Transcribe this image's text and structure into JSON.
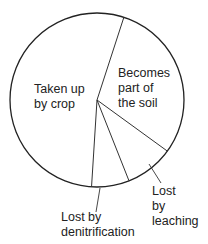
{
  "chart_data": {
    "type": "pie",
    "title": "",
    "start_angle_deg": 18,
    "direction": "clockwise",
    "slices": [
      {
        "label": "Becomes part of the soil",
        "value": 30
      },
      {
        "label": "Lost by leaching",
        "value": 9
      },
      {
        "label": "Lost by denitrification",
        "value": 7
      },
      {
        "label": "Taken up by crop",
        "value": 54
      }
    ],
    "colors": {
      "fill": "#ffffff",
      "stroke": "#222222"
    }
  },
  "labels": {
    "crop": [
      "Taken up",
      "by crop"
    ],
    "soil": [
      "Becomes",
      "part of",
      "the soil"
    ],
    "leaching": [
      "Lost",
      "by",
      "leaching"
    ],
    "denitrification": [
      "Lost by",
      "denitrification"
    ]
  }
}
